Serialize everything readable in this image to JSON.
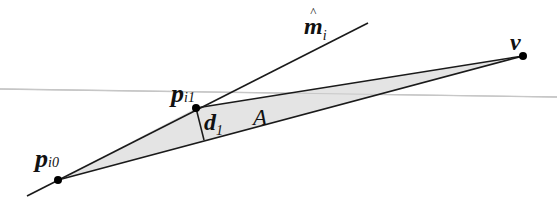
{
  "figure": {
    "colors": {
      "background": "#ffffff",
      "stroke": "#1a1a1a",
      "reference_line": "#bdbdbd",
      "triangle_fill": "#e4e4e4",
      "point": "#000000"
    },
    "points": {
      "p_i0": {
        "x": 58,
        "y": 180
      },
      "p_i1": {
        "x": 196,
        "y": 108
      },
      "v": {
        "x": 523,
        "y": 56
      },
      "d1_foot": {
        "x": 204,
        "y": 140
      }
    },
    "labels": {
      "p_i0": {
        "main": "p",
        "sub": "i0"
      },
      "p_i1": {
        "main": "p",
        "sub": "i1"
      },
      "v": {
        "main": "v"
      },
      "m_hat": {
        "main": "m",
        "hat": "^",
        "sub": "i"
      },
      "d1": {
        "main": "d",
        "sub": "1"
      },
      "area": {
        "main": "A"
      }
    }
  }
}
